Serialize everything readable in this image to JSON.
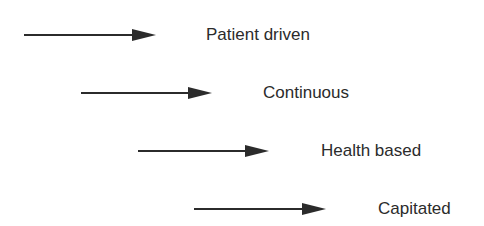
{
  "diagram": {
    "type": "staggered-arrows",
    "arrow_color": "#2b2b2b",
    "text_color": "#2b2b2b",
    "items": [
      {
        "label": "Patient driven",
        "arrow_start_x": 24,
        "arrow_end_x": 156,
        "y": 35,
        "label_x": 206
      },
      {
        "label": "Continuous",
        "arrow_start_x": 81,
        "arrow_end_x": 212,
        "y": 93,
        "label_x": 263
      },
      {
        "label": "Health based",
        "arrow_start_x": 138,
        "arrow_end_x": 269,
        "y": 151,
        "label_x": 321
      },
      {
        "label": "Capitated",
        "arrow_start_x": 194,
        "arrow_end_x": 326,
        "y": 209,
        "label_x": 378
      }
    ]
  }
}
